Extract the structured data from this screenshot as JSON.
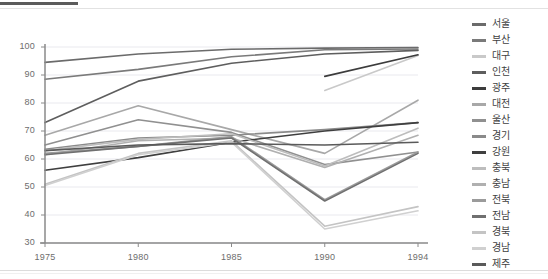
{
  "chart_data": {
    "type": "line",
    "title": "",
    "xlabel": "",
    "ylabel": "",
    "x": [
      1975,
      1980,
      1985,
      1990,
      1994
    ],
    "categories": [
      "1975",
      "1980",
      "1985",
      "1990",
      "1994"
    ],
    "ylim": [
      30,
      100
    ],
    "yticks": [
      30,
      40,
      50,
      60,
      70,
      80,
      90,
      100
    ],
    "grid": true,
    "legend_position": "right",
    "series": [
      {
        "name": "서울",
        "color": "#6b6b6b",
        "values": [
          94.5,
          97.5,
          99.2,
          99.6,
          99.8
        ]
      },
      {
        "name": "부산",
        "color": "#7a7a7a",
        "values": [
          88.5,
          92.0,
          96.5,
          99.0,
          99.3
        ]
      },
      {
        "name": "대구",
        "color": "#c9c9c9",
        "values": [
          null,
          null,
          null,
          84.5,
          97.0
        ]
      },
      {
        "name": "인천",
        "color": "#5e5e5e",
        "values": [
          73.0,
          87.8,
          94.2,
          97.5,
          98.8
        ]
      },
      {
        "name": "광주",
        "color": "#3c3c3c",
        "values": [
          null,
          null,
          null,
          89.5,
          97.2
        ]
      },
      {
        "name": "대전",
        "color": "#a8a8a8",
        "values": [
          68.5,
          79.0,
          70.5,
          62.0,
          81.0
        ]
      },
      {
        "name": "울산",
        "color": "#909090",
        "values": [
          65.0,
          74.0,
          69.5,
          58.0,
          62.5
        ]
      },
      {
        "name": "경기",
        "color": "#8a8a8a",
        "values": [
          63.5,
          67.5,
          68.5,
          70.5,
          73.0
        ]
      },
      {
        "name": "강원",
        "color": "#3f3f3f",
        "values": [
          56.0,
          60.5,
          66.0,
          70.0,
          73.0
        ]
      },
      {
        "name": "충북",
        "color": "#bdbdbd",
        "values": [
          63.0,
          67.0,
          69.0,
          57.5,
          71.0
        ]
      },
      {
        "name": "충남",
        "color": "#b0b0b0",
        "values": [
          61.5,
          66.5,
          67.5,
          57.0,
          68.5
        ]
      },
      {
        "name": "전북",
        "color": "#9b9b9b",
        "values": [
          62.0,
          64.5,
          68.0,
          45.5,
          62.5
        ]
      },
      {
        "name": "전남",
        "color": "#707070",
        "values": [
          61.5,
          64.5,
          67.5,
          45.0,
          62.0
        ]
      },
      {
        "name": "경북",
        "color": "#c4c4c4",
        "values": [
          51.0,
          62.0,
          66.5,
          36.0,
          43.0
        ]
      },
      {
        "name": "경남",
        "color": "#d0d0d0",
        "values": [
          50.5,
          61.5,
          66.0,
          35.0,
          41.5
        ]
      },
      {
        "name": "제주",
        "color": "#5a5a5a",
        "values": [
          63.0,
          65.0,
          65.5,
          65.0,
          66.0
        ]
      }
    ]
  },
  "legend": {
    "items": [
      {
        "label": "서울"
      },
      {
        "label": "부산"
      },
      {
        "label": "대구"
      },
      {
        "label": "인천"
      },
      {
        "label": "광주"
      },
      {
        "label": "대전"
      },
      {
        "label": "울산"
      },
      {
        "label": "경기"
      },
      {
        "label": "강원"
      },
      {
        "label": "충북"
      },
      {
        "label": "충남"
      },
      {
        "label": "전북"
      },
      {
        "label": "전남"
      },
      {
        "label": "경북"
      },
      {
        "label": "경남"
      },
      {
        "label": "제주"
      }
    ]
  },
  "colors": {
    "axis": "#8a8a8a",
    "grid": "#e9e9ee",
    "tick_text": "#6d6d6d",
    "legend_text": "#3f3f3f",
    "top_rule": "#5b5b5b",
    "background": "#ffffff"
  }
}
